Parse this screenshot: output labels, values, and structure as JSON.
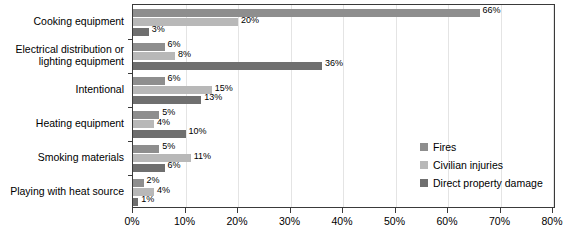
{
  "chart_data": {
    "type": "bar",
    "orientation": "horizontal",
    "title": "",
    "xlabel": "",
    "ylabel": "",
    "xlim": [
      0,
      80
    ],
    "xticks": [
      "0%",
      "10%",
      "20%",
      "30%",
      "40%",
      "50%",
      "60%",
      "70%",
      "80%"
    ],
    "xtick_values": [
      0,
      10,
      20,
      30,
      40,
      50,
      60,
      70,
      80
    ],
    "grid": true,
    "legend_position": "right",
    "categories": [
      "Cooking equipment",
      "Electrical distribution or lighting equipment",
      "Intentional",
      "Heating equipment",
      "Smoking materials",
      "Playing with heat source"
    ],
    "series": [
      {
        "name": "Fires",
        "color": "#8e8e8e",
        "values": [
          66,
          6,
          6,
          5,
          5,
          2
        ],
        "labels": [
          "66%",
          "6%",
          "6%",
          "5%",
          "5%",
          "2%"
        ]
      },
      {
        "name": "Civilian injuries",
        "color": "#b8b8b8",
        "values": [
          20,
          8,
          15,
          4,
          11,
          4
        ],
        "labels": [
          "20%",
          "8%",
          "15%",
          "4%",
          "11%",
          "4%"
        ]
      },
      {
        "name": "Direct property damage",
        "color": "#6f6f6f",
        "values": [
          3,
          36,
          13,
          10,
          6,
          1
        ],
        "labels": [
          "3%",
          "36%",
          "13%",
          "10%",
          "6%",
          "1%"
        ]
      }
    ]
  },
  "category_labels": [
    {
      "lines": [
        "Cooking equipment"
      ]
    },
    {
      "lines": [
        "Electrical distribution or",
        "lighting equipment"
      ]
    },
    {
      "lines": [
        "Intentional"
      ]
    },
    {
      "lines": [
        "Heating equipment"
      ]
    },
    {
      "lines": [
        "Smoking materials"
      ]
    },
    {
      "lines": [
        "Playing with heat source"
      ]
    }
  ],
  "legend": {
    "items": [
      {
        "label": "Fires",
        "color": "#8e8e8e"
      },
      {
        "label": "Civilian injuries",
        "color": "#b8b8b8"
      },
      {
        "label": "Direct property damage",
        "color": "#6f6f6f"
      }
    ]
  }
}
